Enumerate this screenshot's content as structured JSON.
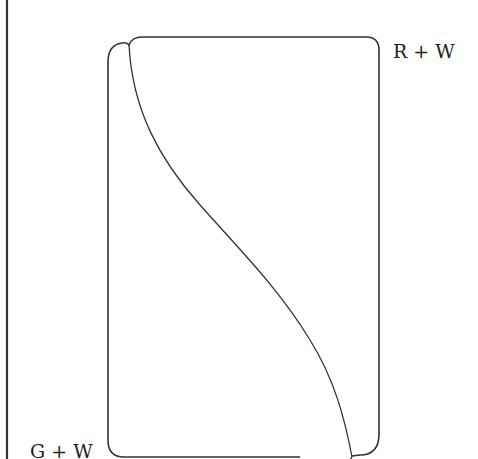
{
  "diagram": {
    "labels": {
      "top_right": "R + W",
      "bottom_left": "G + W"
    },
    "elements": [
      {
        "id": "left-boundary-line",
        "type": "vertical line",
        "x": 7,
        "y_from": 0,
        "y_to": 459
      },
      {
        "id": "rounded-rectangle",
        "type": "rounded rectangle outline",
        "x": 107,
        "y": 37,
        "width": 272,
        "height": 420
      },
      {
        "id": "s-curve",
        "type": "sigmoid curve",
        "from": [
          128,
          43
        ],
        "to": [
          352,
          457
        ]
      }
    ],
    "colors": {
      "stroke": "#333333",
      "text": "#222222",
      "background": "#ffffff"
    }
  }
}
